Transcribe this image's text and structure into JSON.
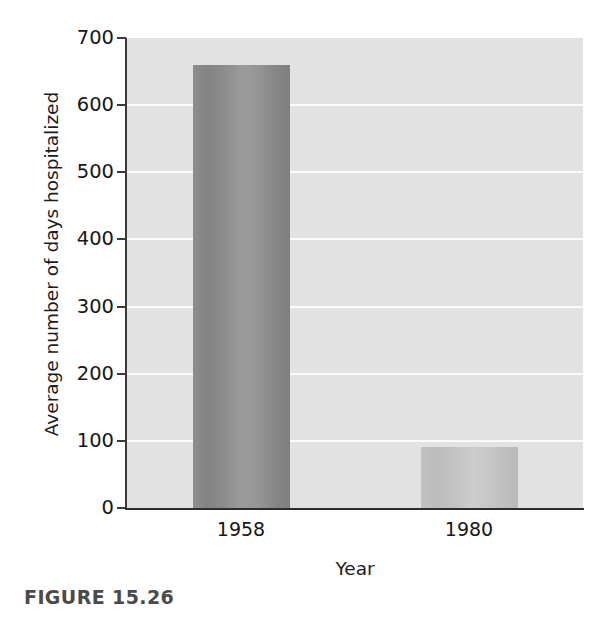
{
  "figure": {
    "caption": "FIGURE 15.26"
  },
  "chart_data": {
    "type": "bar",
    "title": "",
    "subtitle": "",
    "xlabel": "Year",
    "ylabel": "Average number of days hospitalized",
    "categories": [
      "1958",
      "1980"
    ],
    "values": [
      660,
      91
    ],
    "series": [
      {
        "name": "Average number of days hospitalized",
        "values": [
          660,
          91
        ]
      }
    ],
    "ylim": [
      0,
      700
    ],
    "yticks": [
      0,
      100,
      200,
      300,
      400,
      500,
      600,
      700
    ],
    "ytick_labels": [
      "0",
      "100",
      "200",
      "300",
      "400",
      "500",
      "600",
      "700"
    ],
    "xtick_labels": [
      "1958",
      "1980"
    ],
    "grid": "horizontal",
    "grid_color": "#fbfbfb",
    "plot_background": "#e2e2e2",
    "legend": null,
    "legend_position": "none",
    "annotations": [],
    "bar_colors": [
      "#8e8e8e",
      "#c2c2c2"
    ]
  }
}
